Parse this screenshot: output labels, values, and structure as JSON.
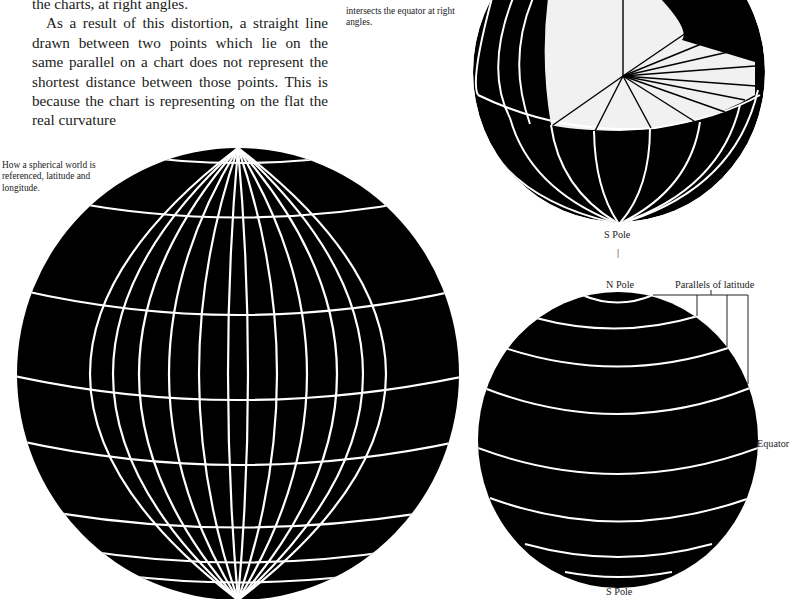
{
  "body_text": {
    "lines": [
      "the charts, at right angles.",
      "As a result of this distortion, a straight line drawn between two points which lie on the same parallel on a chart does not represent the shortest distance between those points. This is because the chart is representing on the flat the real curvature"
    ]
  },
  "captions": {
    "top_right": "intersects the equator at right angles.",
    "big_globe": "How a spherical world is referenced, latitude and longitude."
  },
  "top_globe": {
    "labels": {
      "s_pole": "S Pole",
      "tick": "|"
    }
  },
  "bottom_globe": {
    "labels": {
      "n_pole": "N Pole",
      "parallels": "Parallels of latitude",
      "equator": "Equator",
      "s_pole": "S Pole"
    }
  },
  "colors": {
    "globe_fill": "#000000",
    "grid_lines": "#ffffff",
    "cutaway_fill": "#f1f1f1",
    "text": "#1a1a1a"
  }
}
